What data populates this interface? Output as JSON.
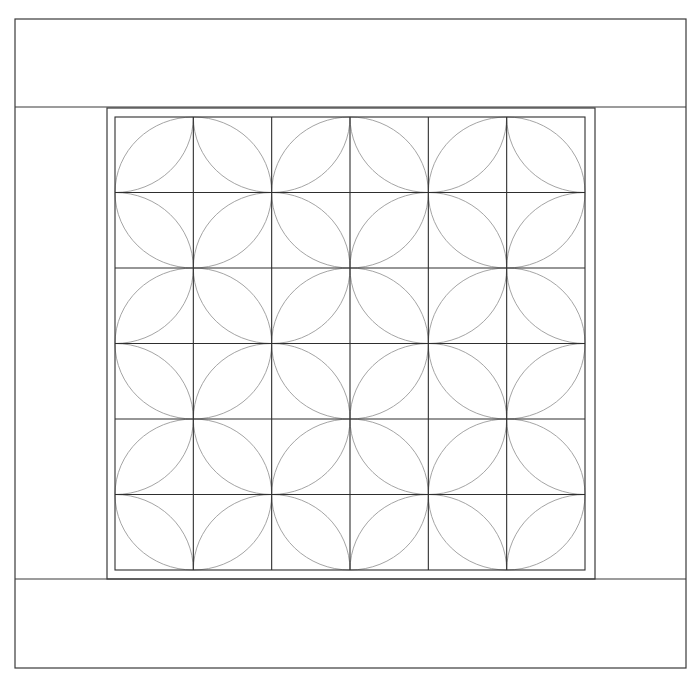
{
  "diagram": {
    "title": "",
    "colors": {
      "background": "#ffffff",
      "frame": "#3a3a3a",
      "grid": "#2e2e2e",
      "arcs": "#9a9a9a"
    },
    "outer_border": {
      "x": 15,
      "y": 19,
      "width": 671,
      "height": 649
    },
    "top_band_line_y": 107,
    "bottom_band_line_y": 579,
    "inner_frame": {
      "x": 107,
      "y": 108,
      "width": 488,
      "height": 471
    },
    "grid": {
      "x": 115,
      "y": 117,
      "width": 470,
      "height": 453,
      "rows": 6,
      "cols": 6,
      "pattern": "orange-peel",
      "cell_orientation_rule": "(row+col) even = leaf from bottom-left to top-right; odd = leaf from top-left to bottom-right"
    }
  }
}
